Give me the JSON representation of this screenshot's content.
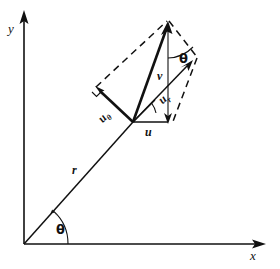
{
  "figure": {
    "kind": "polar-vector-decomposition-diagram",
    "width": 280,
    "height": 269,
    "background_color": "#ffffff",
    "ink_color": "#111111"
  },
  "axes": {
    "x_label": "x",
    "y_label": "y",
    "origin": {
      "x": 24,
      "y": 244
    },
    "x_end": {
      "x": 262,
      "y": 244
    },
    "y_end": {
      "x": 24,
      "y": 14
    }
  },
  "labels": {
    "radius": "r",
    "angle_origin": "θ",
    "angle_top": "θ",
    "vector_u": "u",
    "vector_v": "v",
    "vector_u_theta_base": "u",
    "vector_u_theta_sub": "θ",
    "vector_u_r_base": "u",
    "vector_u_r_sub": "r"
  },
  "geometry": {
    "position_vector": {
      "from": {
        "x": 24,
        "y": 244
      },
      "to": {
        "x": 133,
        "y": 122
      }
    },
    "vector_u": {
      "from": {
        "x": 133,
        "y": 122
      },
      "to": {
        "x": 168,
        "y": 122
      }
    },
    "vector_v": {
      "from": {
        "x": 168,
        "y": 122
      },
      "to": {
        "x": 168,
        "y": 26
      }
    },
    "resultant": {
      "from": {
        "x": 133,
        "y": 122
      },
      "to": {
        "x": 168,
        "y": 24
      }
    },
    "vector_u_theta": {
      "from": {
        "x": 133,
        "y": 122
      },
      "to": {
        "x": 96,
        "y": 87
      }
    },
    "vector_u_r": {
      "from": {
        "x": 133,
        "y": 122
      },
      "to": {
        "x": 192,
        "y": 61
      }
    },
    "parallelogram_corners": [
      {
        "x": 133,
        "y": 122
      },
      {
        "x": 96,
        "y": 87
      },
      {
        "x": 168,
        "y": 22
      },
      {
        "x": 196,
        "y": 57
      }
    ],
    "angle_arc_origin_deg": 48,
    "angle_arc_top_deg": 48
  }
}
